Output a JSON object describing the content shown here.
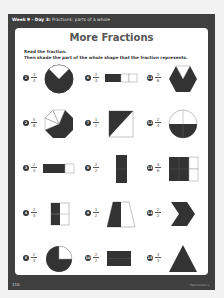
{
  "header": {
    "week_day": "Week 9 · Day 3:",
    "topic": "Fractions: parts of a whole"
  },
  "title": "More Fractions",
  "instructions": {
    "line1": "Read the fraction.",
    "line2": "Then shade the part of the whole shape that the fraction represents."
  },
  "items": [
    {
      "num": "1",
      "n": "3",
      "d": "4",
      "shape": "circle"
    },
    {
      "num": "6",
      "n": "2",
      "d": "4",
      "shape": "bar"
    },
    {
      "num": "11",
      "n": "5",
      "d": "6",
      "shape": "hexagon"
    },
    {
      "num": "2",
      "n": "5",
      "d": "8",
      "shape": "octagon"
    },
    {
      "num": "7",
      "n": "1",
      "d": "2",
      "shape": "square-diagonal"
    },
    {
      "num": "12",
      "n": "2",
      "d": "4",
      "shape": "circle-quarters"
    },
    {
      "num": "3",
      "n": "2",
      "d": "3",
      "shape": "bar-thirds"
    },
    {
      "num": "8",
      "n": "2",
      "d": "2",
      "shape": "rect-vertical"
    },
    {
      "num": "13",
      "n": "4",
      "d": "6",
      "shape": "grid-6"
    },
    {
      "num": "4",
      "n": "2",
      "d": "4",
      "shape": "grid-4"
    },
    {
      "num": "9",
      "n": "1",
      "d": "2",
      "shape": "trapezoid"
    },
    {
      "num": "14",
      "n": "2",
      "d": "2",
      "shape": "chevron"
    },
    {
      "num": "5",
      "n": "2",
      "d": "3",
      "shape": "circle-thirds"
    },
    {
      "num": "10",
      "n": "2",
      "d": "2",
      "shape": "rect-horizontal"
    },
    {
      "num": "15",
      "n": "3",
      "d": "3",
      "shape": "triangle"
    }
  ],
  "footer": {
    "page": "110",
    "right": "Mathematics"
  }
}
